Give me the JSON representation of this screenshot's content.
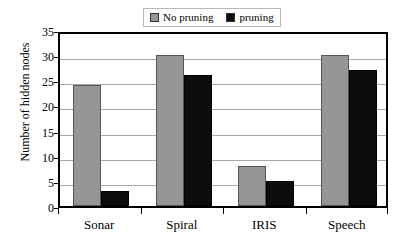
{
  "chart_data": {
    "type": "bar",
    "title": "",
    "xlabel": "",
    "ylabel": "Number of hidden nodes",
    "categories": [
      "Sonar",
      "Spiral",
      "IRIS",
      "Speech"
    ],
    "series": [
      {
        "name": "No pruning",
        "color": "#969696",
        "values": [
          24,
          30,
          8,
          30
        ]
      },
      {
        "name": "pruning",
        "color": "#0d0d0d",
        "values": [
          3,
          26,
          5,
          27
        ]
      }
    ],
    "ylim": [
      0,
      35
    ],
    "y_ticks": [
      0,
      5,
      10,
      15,
      20,
      25,
      30,
      35
    ],
    "y_tick_labels": [
      "0",
      "5",
      "10",
      "15",
      "20",
      "25",
      "30",
      "35"
    ],
    "grid": true,
    "legend_position": "top-center",
    "legend": [
      {
        "label": "No pruning",
        "swatch": "gray-swatch-icon"
      },
      {
        "label": "pruning",
        "swatch": "black-swatch-icon"
      }
    ]
  }
}
